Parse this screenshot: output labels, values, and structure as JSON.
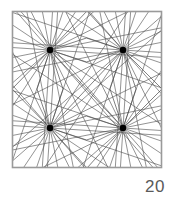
{
  "figure": {
    "label": "20",
    "type": "geometric-line-pattern"
  },
  "colors": {
    "background": "#ffffff",
    "frame_stroke": "#9a9a9a",
    "line_stroke": "#4a4a4a",
    "node_fill": "#000000",
    "label_text": "#5a5a5a"
  },
  "chart_data": {
    "type": "scatter",
    "title": "",
    "xlabel": "",
    "ylabel": "",
    "frame": {
      "x": 12,
      "y": 11,
      "width": 150,
      "height": 157
    },
    "nodes": [
      {
        "id": "top-left",
        "x": 50,
        "y": 50,
        "rays": 24,
        "radius": 3.2
      },
      {
        "id": "top-right",
        "x": 123,
        "y": 50,
        "rays": 24,
        "radius": 3.2
      },
      {
        "id": "bottom-left",
        "x": 50,
        "y": 128,
        "rays": 24,
        "radius": 3.2
      },
      {
        "id": "bottom-right",
        "x": 123,
        "y": 128,
        "rays": 24,
        "radius": 3.2
      }
    ],
    "edge_anchors": [
      {
        "id": "left-mid",
        "x": 12,
        "y": 89
      },
      {
        "id": "right-mid",
        "x": 162,
        "y": 89
      },
      {
        "id": "top-mid",
        "x": 87,
        "y": 11
      },
      {
        "id": "bottom-mid",
        "x": 87,
        "y": 168
      }
    ],
    "grid": false,
    "legend": false
  }
}
